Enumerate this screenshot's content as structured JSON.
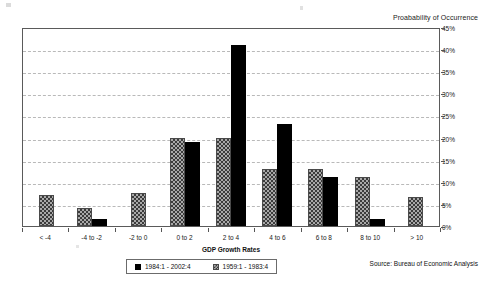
{
  "chart_data": {
    "type": "bar",
    "title": "Proabability of Occurrence",
    "xlabel": "GDP Growth Rates",
    "ylabel": "",
    "ylim": [
      0,
      45
    ],
    "ytick_labels": [
      "0%",
      "5%",
      "10%",
      "15%",
      "20%",
      "25%",
      "30%",
      "35%",
      "40%",
      "45%"
    ],
    "ytick_values": [
      0,
      5,
      10,
      15,
      20,
      25,
      30,
      35,
      40,
      45
    ],
    "grid": true,
    "legend_position": "bottom",
    "categories": [
      "< -4",
      "-4 to -2",
      "-2 to 0",
      "0 to 2",
      "2 to 4",
      "4 to 6",
      "6 to 8",
      "8 to 10",
      "> 10"
    ],
    "series": [
      {
        "name": "1984:1 - 2002:4",
        "color": "#000000",
        "pattern": "solid",
        "values": [
          0,
          1.5,
          0,
          19,
          41,
          23,
          11,
          1.5,
          0
        ]
      },
      {
        "name": "1959:1 - 1983:4",
        "color": "#a8a8a8",
        "pattern": "checker-hatch",
        "values": [
          7,
          4,
          7.5,
          20,
          20,
          13,
          13,
          11,
          6.5
        ]
      }
    ],
    "annotations": [
      "Source: Bureau of Economic Analysis"
    ]
  },
  "chart": {
    "title": "Proabability of Occurrence",
    "axis_title": "GDP Growth Rates",
    "source": "Source: Bureau of Economic Analysis"
  },
  "legend": {
    "items": [
      {
        "label": "1984:1 - 2002:4"
      },
      {
        "label": "1959:1 - 1983:4"
      }
    ]
  }
}
